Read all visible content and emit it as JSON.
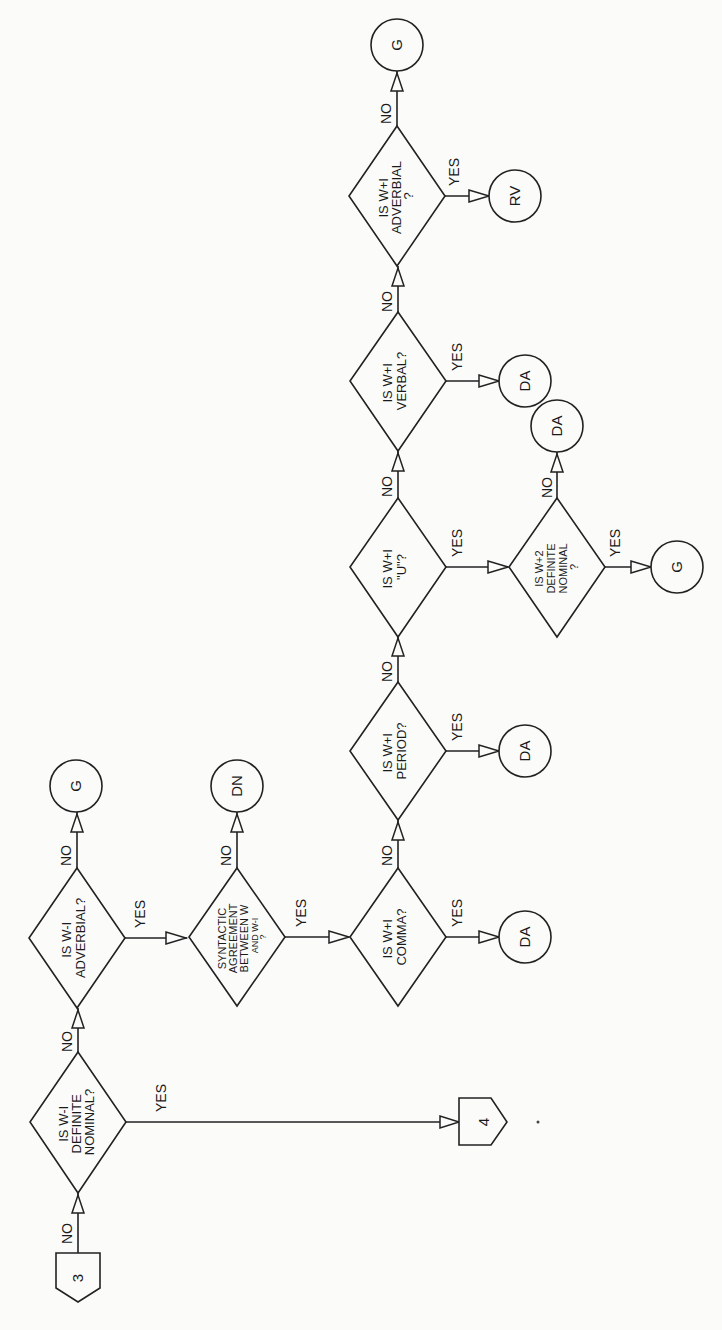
{
  "diagram": {
    "orientation": "rotated-90-ccw",
    "connectors": {
      "entry": {
        "label": "3"
      },
      "exit": {
        "label": "4"
      }
    },
    "decisions": {
      "d1": {
        "lines": [
          "IS W-I",
          "DEFINITE",
          "NOMINAL?"
        ]
      },
      "d2": {
        "lines": [
          "IS W-I",
          "ADVERBIAL?"
        ]
      },
      "d3": {
        "lines": [
          "SYNTACTIC",
          "AGREEMENT",
          "BETWEEN W",
          "AND W-I",
          "?"
        ]
      },
      "d4": {
        "lines": [
          "IS W+I",
          "COMMA?"
        ]
      },
      "d5": {
        "lines": [
          "IS W+I",
          "PERIOD?"
        ]
      },
      "d6": {
        "lines": [
          "IS W+I",
          "\"U\"?"
        ]
      },
      "d7": {
        "lines": [
          "IS W+2",
          "DEFINITE",
          "NOMINAL",
          "?"
        ]
      },
      "d8": {
        "lines": [
          "IS W+I",
          "VERBAL?"
        ]
      },
      "d9": {
        "lines": [
          "IS W+I",
          "ADVERBIAL",
          "?"
        ]
      }
    },
    "terminals": {
      "t_g1": "G",
      "t_dn": "DN",
      "t_da_comma": "DA",
      "t_da_period": "DA",
      "t_da_w2": "DA",
      "t_g_w2": "G",
      "t_da_verbal": "DA",
      "t_rv": "RV",
      "t_g_end": "G"
    },
    "edge_labels": {
      "yes": "YES",
      "no": "NO"
    }
  }
}
